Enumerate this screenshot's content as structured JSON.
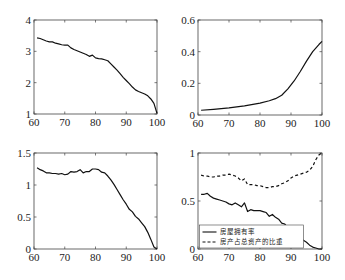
{
  "figure": {
    "width": 345,
    "height": 280,
    "line_color": "#111111",
    "axis_color": "#444444"
  },
  "chart_data": [
    {
      "id": "top-left",
      "type": "line",
      "title": "",
      "xlabel": "",
      "ylabel": "",
      "box": [
        34,
        20,
        157,
        114
      ],
      "xlim": [
        60,
        100
      ],
      "ylim": [
        1,
        4
      ],
      "xticks": [
        60,
        70,
        80,
        90,
        100
      ],
      "yticks": [
        1,
        2,
        3,
        4
      ],
      "grid": false,
      "series": [
        {
          "name": "",
          "style": "solid",
          "x": [
            61,
            62,
            63,
            64,
            65,
            66,
            67,
            68,
            69,
            70,
            71,
            72,
            73,
            74,
            75,
            76,
            77,
            78,
            79,
            80,
            81,
            82,
            83,
            84,
            85,
            86,
            87,
            88,
            89,
            90,
            91,
            92,
            93,
            94,
            95,
            96,
            97,
            98,
            99,
            100
          ],
          "y": [
            3.43,
            3.41,
            3.37,
            3.33,
            3.3,
            3.3,
            3.26,
            3.24,
            3.21,
            3.2,
            3.2,
            3.11,
            3.06,
            3.02,
            2.98,
            2.94,
            2.9,
            2.84,
            2.88,
            2.79,
            2.77,
            2.76,
            2.73,
            2.7,
            2.6,
            2.5,
            2.4,
            2.29,
            2.17,
            2.07,
            1.97,
            1.86,
            1.77,
            1.72,
            1.68,
            1.64,
            1.58,
            1.48,
            1.34,
            1.02
          ]
        }
      ]
    },
    {
      "id": "top-right",
      "type": "line",
      "title": "",
      "xlabel": "",
      "ylabel": "",
      "box": [
        198,
        20,
        322,
        115
      ],
      "xlim": [
        60,
        100
      ],
      "ylim": [
        0,
        0.6
      ],
      "xticks": [
        60,
        70,
        80,
        90,
        100
      ],
      "yticks": [
        0,
        0.2,
        0.4,
        0.6
      ],
      "grid": false,
      "series": [
        {
          "name": "",
          "style": "solid",
          "x": [
            61,
            65,
            70,
            75,
            80,
            83,
            85,
            87,
            89,
            91,
            93,
            95,
            97,
            99,
            100
          ],
          "y": [
            0.03,
            0.036,
            0.045,
            0.058,
            0.075,
            0.09,
            0.103,
            0.125,
            0.165,
            0.215,
            0.275,
            0.34,
            0.4,
            0.445,
            0.465
          ]
        }
      ]
    },
    {
      "id": "bottom-left",
      "type": "line",
      "title": "",
      "xlabel": "",
      "ylabel": "",
      "box": [
        34,
        153,
        157,
        249
      ],
      "xlim": [
        60,
        100
      ],
      "ylim": [
        0,
        1.5
      ],
      "xticks": [
        60,
        70,
        80,
        90,
        100
      ],
      "yticks": [
        0,
        0.5,
        1,
        1.5
      ],
      "grid": false,
      "series": [
        {
          "name": "",
          "style": "solid",
          "x": [
            61,
            62,
            63,
            64,
            65,
            66,
            67,
            68,
            69,
            70,
            71,
            72,
            73,
            74,
            75,
            76,
            77,
            78,
            79,
            80,
            81,
            82,
            83,
            84,
            85,
            86,
            87,
            88,
            89,
            90,
            91,
            92,
            93,
            94,
            95,
            96,
            97,
            98,
            99,
            100
          ],
          "y": [
            1.27,
            1.24,
            1.22,
            1.19,
            1.19,
            1.18,
            1.18,
            1.17,
            1.18,
            1.16,
            1.17,
            1.21,
            1.2,
            1.21,
            1.24,
            1.19,
            1.21,
            1.21,
            1.25,
            1.25,
            1.24,
            1.2,
            1.19,
            1.14,
            1.08,
            1.01,
            0.93,
            0.85,
            0.77,
            0.7,
            0.62,
            0.58,
            0.51,
            0.47,
            0.41,
            0.35,
            0.26,
            0.15,
            0.03,
            0.0
          ]
        }
      ]
    },
    {
      "id": "bottom-right",
      "type": "line",
      "title": "",
      "xlabel": "",
      "ylabel": "",
      "box": [
        198,
        153,
        322,
        249
      ],
      "xlim": [
        60,
        100
      ],
      "ylim": [
        0,
        1
      ],
      "xticks": [
        60,
        70,
        80,
        90,
        100
      ],
      "yticks": [
        0,
        0.5,
        1
      ],
      "grid": false,
      "legend_position": "lower left",
      "series": [
        {
          "name": "房屋拥有率",
          "style": "solid",
          "x": [
            61,
            62,
            63,
            64,
            65,
            66,
            67,
            68,
            69,
            70,
            71,
            72,
            73,
            74,
            75,
            76,
            77,
            78,
            79,
            80,
            81,
            82,
            83,
            84,
            85,
            86,
            87,
            88,
            89,
            90,
            91,
            92,
            93,
            94,
            95,
            96,
            97,
            98,
            99,
            100
          ],
          "y": [
            0.57,
            0.57,
            0.58,
            0.55,
            0.53,
            0.52,
            0.51,
            0.5,
            0.49,
            0.47,
            0.46,
            0.48,
            0.46,
            0.44,
            0.48,
            0.39,
            0.41,
            0.4,
            0.4,
            0.4,
            0.39,
            0.38,
            0.34,
            0.36,
            0.33,
            0.31,
            0.27,
            0.26,
            0.22,
            0.2,
            0.17,
            0.15,
            0.12,
            0.09,
            0.07,
            0.04,
            0.02,
            0.01,
            0.0,
            0.0
          ]
        },
        {
          "name": "房产占总资产的比重",
          "style": "dashed",
          "x": [
            61,
            62,
            63,
            64,
            65,
            66,
            67,
            68,
            69,
            70,
            71,
            72,
            73,
            74,
            75,
            76,
            77,
            78,
            79,
            80,
            81,
            82,
            83,
            84,
            85,
            86,
            87,
            88,
            89,
            90,
            91,
            92,
            93,
            94,
            95,
            96,
            97,
            98,
            99,
            100
          ],
          "y": [
            0.77,
            0.76,
            0.76,
            0.75,
            0.75,
            0.76,
            0.76,
            0.77,
            0.77,
            0.78,
            0.77,
            0.76,
            0.74,
            0.71,
            0.73,
            0.67,
            0.67,
            0.67,
            0.66,
            0.66,
            0.65,
            0.64,
            0.64,
            0.65,
            0.65,
            0.66,
            0.68,
            0.69,
            0.71,
            0.74,
            0.76,
            0.77,
            0.78,
            0.79,
            0.8,
            0.82,
            0.86,
            0.93,
            0.98,
            1.0
          ]
        }
      ]
    }
  ]
}
